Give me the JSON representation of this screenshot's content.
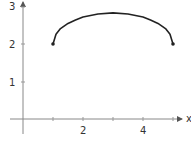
{
  "chart_data": {
    "type": "line",
    "title": "",
    "xlabel": "x",
    "ylabel": "",
    "xlim": [
      -0.2,
      5.6
    ],
    "ylim": [
      -0.4,
      3.1
    ],
    "grid": false,
    "legend": null,
    "x_ticks": [
      2,
      4
    ],
    "y_ticks": [
      1,
      2,
      3
    ],
    "x_tick_labels": [
      "2",
      "4"
    ],
    "y_tick_labels": [
      "1",
      "2",
      "3"
    ],
    "series": [
      {
        "name": "curve",
        "color": "#222222",
        "endpoints": [
          [
            1,
            2
          ],
          [
            5,
            2
          ]
        ],
        "x": [
          1,
          1.1,
          1.25,
          1.5,
          1.75,
          2,
          2.5,
          3,
          3.5,
          4,
          4.25,
          4.5,
          4.75,
          4.9,
          5
        ],
        "y": [
          2,
          2.26,
          2.41,
          2.55,
          2.64,
          2.72,
          2.8,
          2.83,
          2.8,
          2.72,
          2.64,
          2.55,
          2.41,
          2.26,
          2
        ]
      }
    ]
  },
  "axes": {
    "x_label": "x",
    "tick_2": "2",
    "tick_4": "4",
    "y_tick_1": "1",
    "y_tick_2": "2",
    "y_tick_3": "3"
  }
}
